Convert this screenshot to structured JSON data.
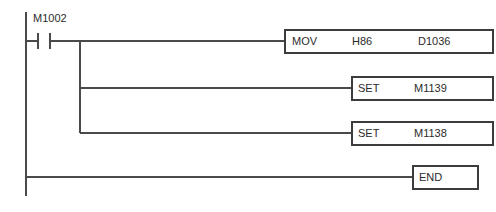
{
  "diagram": {
    "type": "ladder-logic",
    "colors": {
      "wire": "#4a4a4a",
      "box_border": "#3c3c3c",
      "text": "#2b2b2b",
      "background": "#ffffff"
    }
  },
  "contacts": [
    {
      "id": "contact-m1002",
      "label": "M1002",
      "kind": "normally-open"
    }
  ],
  "instructions": [
    {
      "id": "mov-block",
      "mnemonic": "MOV",
      "operand1": "H86",
      "operand2": "D1036"
    },
    {
      "id": "set-block-1",
      "mnemonic": "SET",
      "operand1": "M1139",
      "operand2": ""
    },
    {
      "id": "set-block-2",
      "mnemonic": "SET",
      "operand1": "M1138",
      "operand2": ""
    }
  ],
  "end_block": {
    "id": "end-block",
    "mnemonic": "END"
  }
}
